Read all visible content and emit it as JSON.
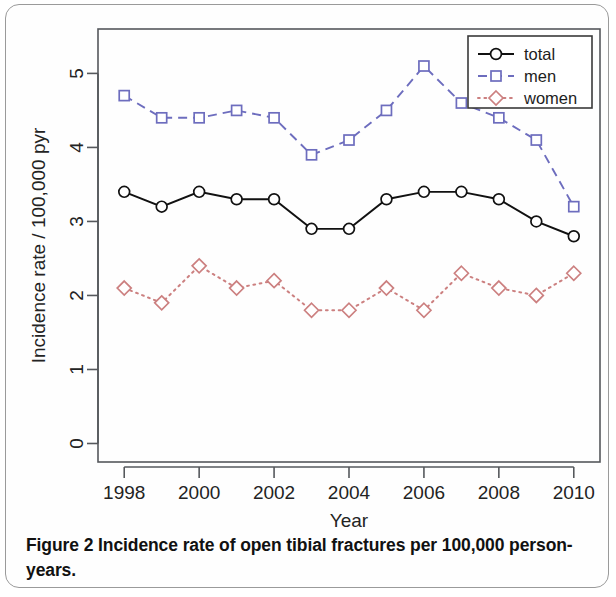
{
  "figure": {
    "caption_label": "Figure 2",
    "caption_text": " Incidence rate of open tibial fractures per 100,000 person-years."
  },
  "chart_data": {
    "type": "line",
    "title": "",
    "xlabel": "Year",
    "ylabel": "Incidence rate / 100,000 pyr",
    "x": [
      1998,
      1999,
      2000,
      2001,
      2002,
      2003,
      2004,
      2005,
      2006,
      2007,
      2008,
      2009,
      2010
    ],
    "xtick_labels": [
      "1998",
      "2000",
      "2002",
      "2004",
      "2006",
      "2008",
      "2010"
    ],
    "xticks": [
      1998,
      2000,
      2002,
      2004,
      2006,
      2008,
      2010
    ],
    "ytick_labels": [
      "0",
      "1",
      "2",
      "3",
      "4",
      "5"
    ],
    "yticks": [
      0,
      1,
      2,
      3,
      4,
      5
    ],
    "xlim": [
      1997.3,
      2010.7
    ],
    "ylim": [
      -0.25,
      5.6
    ],
    "grid": false,
    "legend_position": "top-right",
    "series": [
      {
        "name": "total",
        "color": "#111111",
        "linestyle": "solid",
        "marker": "circle",
        "values": [
          3.4,
          3.2,
          3.4,
          3.3,
          3.3,
          2.9,
          2.9,
          3.3,
          3.4,
          3.4,
          3.3,
          3.0,
          2.8
        ]
      },
      {
        "name": "men",
        "color": "#6d6dbe",
        "linestyle": "dashed",
        "marker": "square",
        "values": [
          4.7,
          4.4,
          4.4,
          4.5,
          4.4,
          3.9,
          4.1,
          4.5,
          5.1,
          4.6,
          4.4,
          4.1,
          3.2
        ]
      },
      {
        "name": "women",
        "color": "#cc8080",
        "linestyle": "dotted",
        "marker": "diamond",
        "values": [
          2.1,
          1.9,
          2.4,
          2.1,
          2.2,
          1.8,
          1.8,
          2.1,
          1.8,
          2.3,
          2.1,
          2.0,
          2.3
        ]
      }
    ]
  },
  "legend": {
    "entries": [
      "total",
      "men",
      "women"
    ]
  }
}
